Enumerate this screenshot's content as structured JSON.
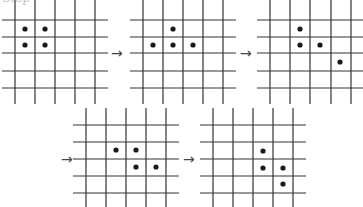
{
  "figure": {
    "cropped_caption": "Step",
    "line_color": "#333333",
    "dot_color": "#1a1a1a",
    "dot_radius": 2.6,
    "line_width": 1.2,
    "arrow_glyph": "→",
    "grids": [
      {
        "id": "grid-1",
        "verticals": [
          15,
          35,
          55,
          75,
          95
        ],
        "horizontals": [
          20,
          37,
          53,
          71,
          88
        ],
        "h_span": [
          2,
          108
        ],
        "v_span": [
          0,
          104
        ],
        "dots": [
          [
            25,
            29
          ],
          [
            45,
            29
          ],
          [
            25,
            45
          ],
          [
            45,
            45
          ]
        ]
      },
      {
        "id": "grid-2",
        "verticals": [
          143,
          163,
          183,
          203,
          223
        ],
        "horizontals": [
          20,
          37,
          53,
          71,
          88
        ],
        "h_span": [
          130,
          236
        ],
        "v_span": [
          0,
          104
        ],
        "dots": [
          [
            173,
            29
          ],
          [
            153,
            45
          ],
          [
            173,
            45
          ],
          [
            193,
            45
          ]
        ]
      },
      {
        "id": "grid-3",
        "verticals": [
          270,
          290,
          310,
          331,
          351
        ],
        "horizontals": [
          20,
          37,
          53,
          71,
          88
        ],
        "h_span": [
          257,
          363
        ],
        "v_span": [
          0,
          104
        ],
        "dots": [
          [
            300,
            29
          ],
          [
            300,
            45
          ],
          [
            320,
            45
          ],
          [
            340,
            62
          ]
        ]
      },
      {
        "id": "grid-4",
        "verticals": [
          86,
          106,
          126,
          146,
          166
        ],
        "horizontals": [
          125,
          142,
          159,
          176,
          193
        ],
        "h_span": [
          73,
          179
        ],
        "v_span": [
          108,
          207
        ],
        "dots": [
          [
            116,
            150
          ],
          [
            136,
            150
          ],
          [
            136,
            167
          ],
          [
            156,
            167
          ]
        ]
      },
      {
        "id": "grid-5",
        "verticals": [
          213,
          233,
          253,
          273,
          293
        ],
        "horizontals": [
          125,
          142,
          159,
          176,
          193
        ],
        "h_span": [
          200,
          306
        ],
        "v_span": [
          108,
          207
        ],
        "dots": [
          [
            263,
            151
          ],
          [
            263,
            168
          ],
          [
            283,
            168
          ],
          [
            283,
            184
          ]
        ]
      }
    ],
    "arrows": [
      {
        "id": "arrow-1-2",
        "x": 111,
        "y": 46
      },
      {
        "id": "arrow-2-3",
        "x": 240,
        "y": 46
      },
      {
        "id": "arrow-3-4",
        "x": 61,
        "y": 152
      },
      {
        "id": "arrow-4-5",
        "x": 183,
        "y": 152
      }
    ]
  }
}
